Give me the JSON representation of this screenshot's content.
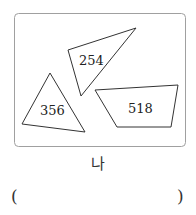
{
  "figure": {
    "frame_color": "#a0a0a0",
    "stroke_color": "#333333",
    "shapes": [
      {
        "name": "top-triangle",
        "value": "254"
      },
      {
        "name": "left-triangle",
        "value": "356"
      },
      {
        "name": "quadrilateral",
        "value": "518"
      }
    ],
    "caption": "나"
  },
  "answer": {
    "open_paren": "(",
    "close_paren": ")",
    "value": ""
  }
}
